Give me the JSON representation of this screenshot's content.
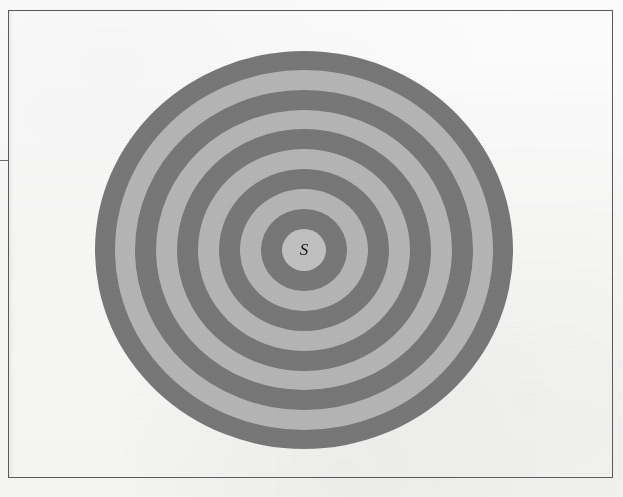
{
  "figure": {
    "center_label": "S",
    "background_color": "#fdfdfc",
    "border_color": "#5a5a5a",
    "dark_band_color": "#787878",
    "light_band_color": "#b6b6b6",
    "center_fill_color": "#c2c2c2"
  },
  "frame": {
    "x": 8,
    "y": 10,
    "width": 605,
    "height": 468
  },
  "chart_data": {
    "type": "scatter",
    "xlabel": "",
    "ylabel": "",
    "center": {
      "cx": 304,
      "cy": 250
    },
    "radius_x": 209,
    "radius_y": 199,
    "band_count": 10,
    "bands": [
      {
        "index": 1,
        "shade": "light",
        "outer_radius_x": 22,
        "outer_radius_y": 21,
        "color": "#c2c2c2",
        "label": "S"
      },
      {
        "index": 2,
        "shade": "dark",
        "outer_radius_x": 43,
        "outer_radius_y": 41,
        "color": "#787878",
        "label": ""
      },
      {
        "index": 3,
        "shade": "light",
        "outer_radius_x": 64,
        "outer_radius_y": 61,
        "color": "#b6b6b6",
        "label": ""
      },
      {
        "index": 4,
        "shade": "dark",
        "outer_radius_x": 85,
        "outer_radius_y": 81,
        "color": "#787878",
        "label": ""
      },
      {
        "index": 5,
        "shade": "light",
        "outer_radius_x": 106,
        "outer_radius_y": 101,
        "color": "#b6b6b6",
        "label": ""
      },
      {
        "index": 6,
        "shade": "dark",
        "outer_radius_x": 127,
        "outer_radius_y": 121,
        "color": "#787878",
        "label": ""
      },
      {
        "index": 7,
        "shade": "light",
        "outer_radius_x": 148,
        "outer_radius_y": 140,
        "color": "#b6b6b6",
        "label": ""
      },
      {
        "index": 8,
        "shade": "dark",
        "outer_radius_x": 169,
        "outer_radius_y": 160,
        "color": "#787878",
        "label": ""
      },
      {
        "index": 9,
        "shade": "light",
        "outer_radius_x": 189,
        "outer_radius_y": 180,
        "color": "#b6b6b6",
        "label": ""
      },
      {
        "index": 10,
        "shade": "dark",
        "outer_radius_x": 209,
        "outer_radius_y": 199,
        "color": "#787878",
        "label": ""
      }
    ],
    "legend": [],
    "annotations": [
      {
        "text": "S",
        "x": 304,
        "y": 250
      }
    ]
  }
}
